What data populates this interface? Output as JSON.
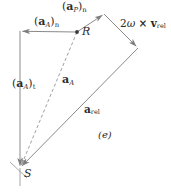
{
  "figure": {
    "caption": "(e)",
    "background": "#ffffff",
    "stroke_color": "#8a8a8a",
    "text_color": "#2b2b2b",
    "width": 171,
    "height": 194
  },
  "points": [
    {
      "name": "R",
      "label": "R",
      "x": 77,
      "y": 32,
      "dot": true
    },
    {
      "name": "S",
      "label": "S",
      "x": 20,
      "y": 168,
      "dot": false
    }
  ],
  "labels": {
    "a_A_n": {
      "base": "a",
      "sub_vec": "A",
      "sub_outer": "n",
      "text": "(a_A)_n"
    },
    "a_P_n": {
      "base": "a",
      "sub_vec": "P",
      "sub_outer": "n",
      "text": "(a_P)_n"
    },
    "a_A_t": {
      "base": "a",
      "sub_vec": "A",
      "sub_outer": "t",
      "text": "(a_A)_t"
    },
    "a_A": {
      "base": "a",
      "sub_vec": "A",
      "text": "a_A"
    },
    "a_rel": {
      "base": "a",
      "sub_vec": "rel",
      "text": "a_rel"
    },
    "coriolis": {
      "text": "2ω × v_rel",
      "scalar": "2ω",
      "cross": "×",
      "vector": "v",
      "sub": "rel"
    },
    "caption": "(e)"
  },
  "vectors": [
    {
      "name": "a_A_n",
      "from": [
        77,
        32
      ],
      "to": [
        20,
        31
      ],
      "style": "solid",
      "arrow_at": "to"
    },
    {
      "name": "a_A_t",
      "from": [
        20,
        31
      ],
      "to": [
        20,
        168
      ],
      "style": "solid",
      "arrow_at": "to"
    },
    {
      "name": "a_A",
      "from": [
        77,
        32
      ],
      "to": [
        20,
        168
      ],
      "style": "dashed",
      "arrow_at": "to"
    },
    {
      "name": "a_P_n",
      "from": [
        77,
        32
      ],
      "to": [
        104,
        14
      ],
      "style": "solid",
      "arrow_at": "to"
    },
    {
      "name": "coriolis",
      "from": [
        104,
        14
      ],
      "to": [
        138,
        48
      ],
      "style": "solid",
      "arrow_at": "to"
    },
    {
      "name": "a_rel",
      "from": [
        138,
        48
      ],
      "to": [
        20,
        168
      ],
      "style": "solid",
      "arrow_at": "to"
    }
  ]
}
